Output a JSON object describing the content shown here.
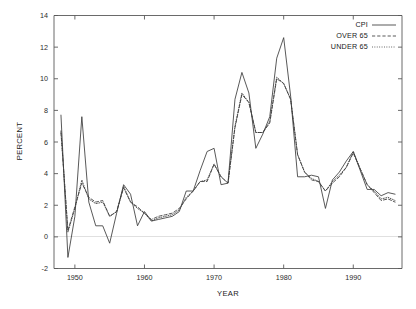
{
  "chart_data": {
    "type": "line",
    "title": "",
    "xlabel": "YEAR",
    "ylabel": "PERCENT",
    "xlim": [
      1947,
      1997
    ],
    "ylim": [
      -2,
      14
    ],
    "xticks": [
      1950,
      1960,
      1970,
      1980,
      1990
    ],
    "yticks": [
      -2,
      0,
      2,
      4,
      6,
      8,
      10,
      12,
      14
    ],
    "grid": false,
    "legend_position": "top-right",
    "x": [
      1948,
      1949,
      1950,
      1951,
      1952,
      1953,
      1954,
      1955,
      1956,
      1957,
      1958,
      1959,
      1960,
      1961,
      1962,
      1963,
      1964,
      1965,
      1966,
      1967,
      1968,
      1969,
      1970,
      1971,
      1972,
      1973,
      1974,
      1975,
      1976,
      1977,
      1978,
      1979,
      1980,
      1981,
      1982,
      1983,
      1984,
      1985,
      1986,
      1987,
      1988,
      1989,
      1990,
      1991,
      1992,
      1993,
      1994,
      1995,
      1996
    ],
    "series": [
      {
        "name": "CPI",
        "style": "solid",
        "values": [
          7.7,
          -1.3,
          1.3,
          7.6,
          2.2,
          0.7,
          0.7,
          -0.4,
          1.5,
          3.3,
          2.7,
          0.7,
          1.6,
          1.0,
          1.1,
          1.2,
          1.3,
          1.6,
          2.9,
          2.9,
          4.2,
          5.4,
          5.6,
          3.3,
          3.4,
          8.7,
          10.4,
          9.1,
          5.6,
          6.5,
          7.6,
          11.3,
          12.6,
          8.9,
          3.8,
          3.8,
          3.9,
          3.8,
          1.8,
          3.6,
          4.1,
          4.8,
          5.4,
          4.2,
          3.0,
          3.0,
          2.6,
          2.8,
          2.7
        ]
      },
      {
        "name": "OVER 65",
        "style": "dashed",
        "values": [
          6.6,
          0.4,
          1.9,
          3.4,
          2.5,
          2.2,
          2.3,
          1.3,
          1.6,
          3.1,
          2.2,
          1.9,
          1.5,
          1.1,
          1.3,
          1.4,
          1.5,
          1.8,
          2.4,
          2.9,
          3.5,
          3.5,
          4.6,
          3.8,
          3.4,
          6.9,
          9.0,
          8.5,
          6.6,
          6.6,
          7.2,
          10.0,
          9.7,
          8.7,
          5.2,
          4.1,
          3.6,
          3.5,
          2.9,
          3.4,
          3.8,
          4.4,
          5.3,
          4.3,
          3.3,
          2.8,
          2.3,
          2.4,
          2.2
        ]
      },
      {
        "name": "UNDER 65",
        "style": "dotted",
        "values": [
          6.7,
          0.3,
          1.8,
          3.6,
          2.4,
          2.1,
          2.2,
          1.3,
          1.6,
          3.2,
          2.2,
          1.8,
          1.5,
          1.0,
          1.2,
          1.3,
          1.4,
          1.7,
          2.5,
          2.9,
          3.5,
          3.6,
          4.6,
          3.8,
          3.4,
          7.0,
          9.1,
          8.5,
          6.6,
          6.6,
          7.3,
          10.1,
          9.7,
          8.7,
          5.2,
          4.1,
          3.7,
          3.5,
          2.9,
          3.5,
          3.9,
          4.4,
          5.4,
          4.3,
          3.3,
          2.9,
          2.4,
          2.5,
          2.3
        ]
      }
    ]
  },
  "axes": {
    "y_title": "PERCENT",
    "x_title": "YEAR",
    "y_tick_labels": [
      "14",
      "12",
      "10",
      "8",
      "6",
      "4",
      "2",
      "0",
      "-2"
    ],
    "x_tick_labels": [
      "1950",
      "1960",
      "1970",
      "1980",
      "1990"
    ]
  },
  "legend": {
    "entries": [
      {
        "label": "CPI",
        "style": "solid"
      },
      {
        "label": "OVER 65",
        "style": "dashed"
      },
      {
        "label": "UNDER 65",
        "style": "dotted"
      }
    ]
  },
  "colors": {
    "line": "#3b3b3b",
    "frame": "#595959",
    "text": "#1a1a1a",
    "zero_line": "#d8d8d8",
    "background": "#ffffff"
  }
}
